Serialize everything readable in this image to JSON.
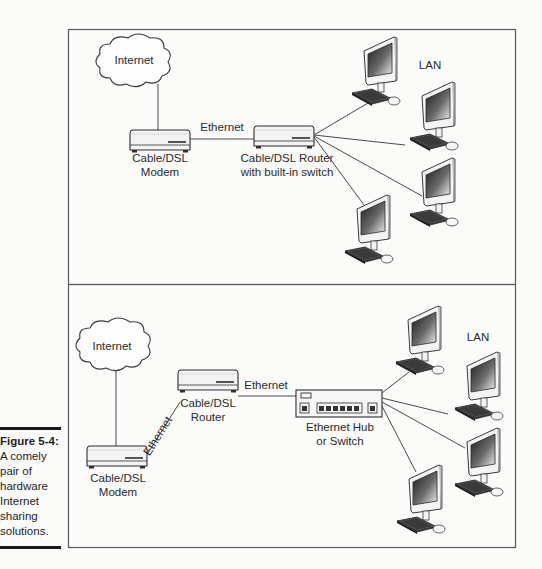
{
  "figure": {
    "number": "Figure 5-4:",
    "caption_lines": [
      "A comely",
      "pair of",
      "hardware",
      "Internet",
      "sharing",
      "solutions."
    ]
  },
  "panels": [
    {
      "id": "top",
      "internet_label": "Internet",
      "modem_label": [
        "Cable/DSL",
        "Modem"
      ],
      "link_label": "Ethernet",
      "router_label": [
        "Cable/DSL Router",
        "with built-in switch"
      ],
      "lan_label": "LAN",
      "computer_count": 4
    },
    {
      "id": "bottom",
      "internet_label": "Internet",
      "modem_label": [
        "Cable/DSL",
        "Modem"
      ],
      "modem_router_link_label": "Ethernet",
      "router_label": [
        "Cable/DSL",
        "Router"
      ],
      "router_hub_link_label": "Ethernet",
      "hub_label": [
        "Ethernet Hub",
        "or Switch"
      ],
      "lan_label": "LAN",
      "computer_count": 4
    }
  ],
  "colors": {
    "line": "#4a4a4a",
    "border": "#5a5a5a",
    "screen_dark": "#222222",
    "screen_light": "#e8e8e8"
  }
}
